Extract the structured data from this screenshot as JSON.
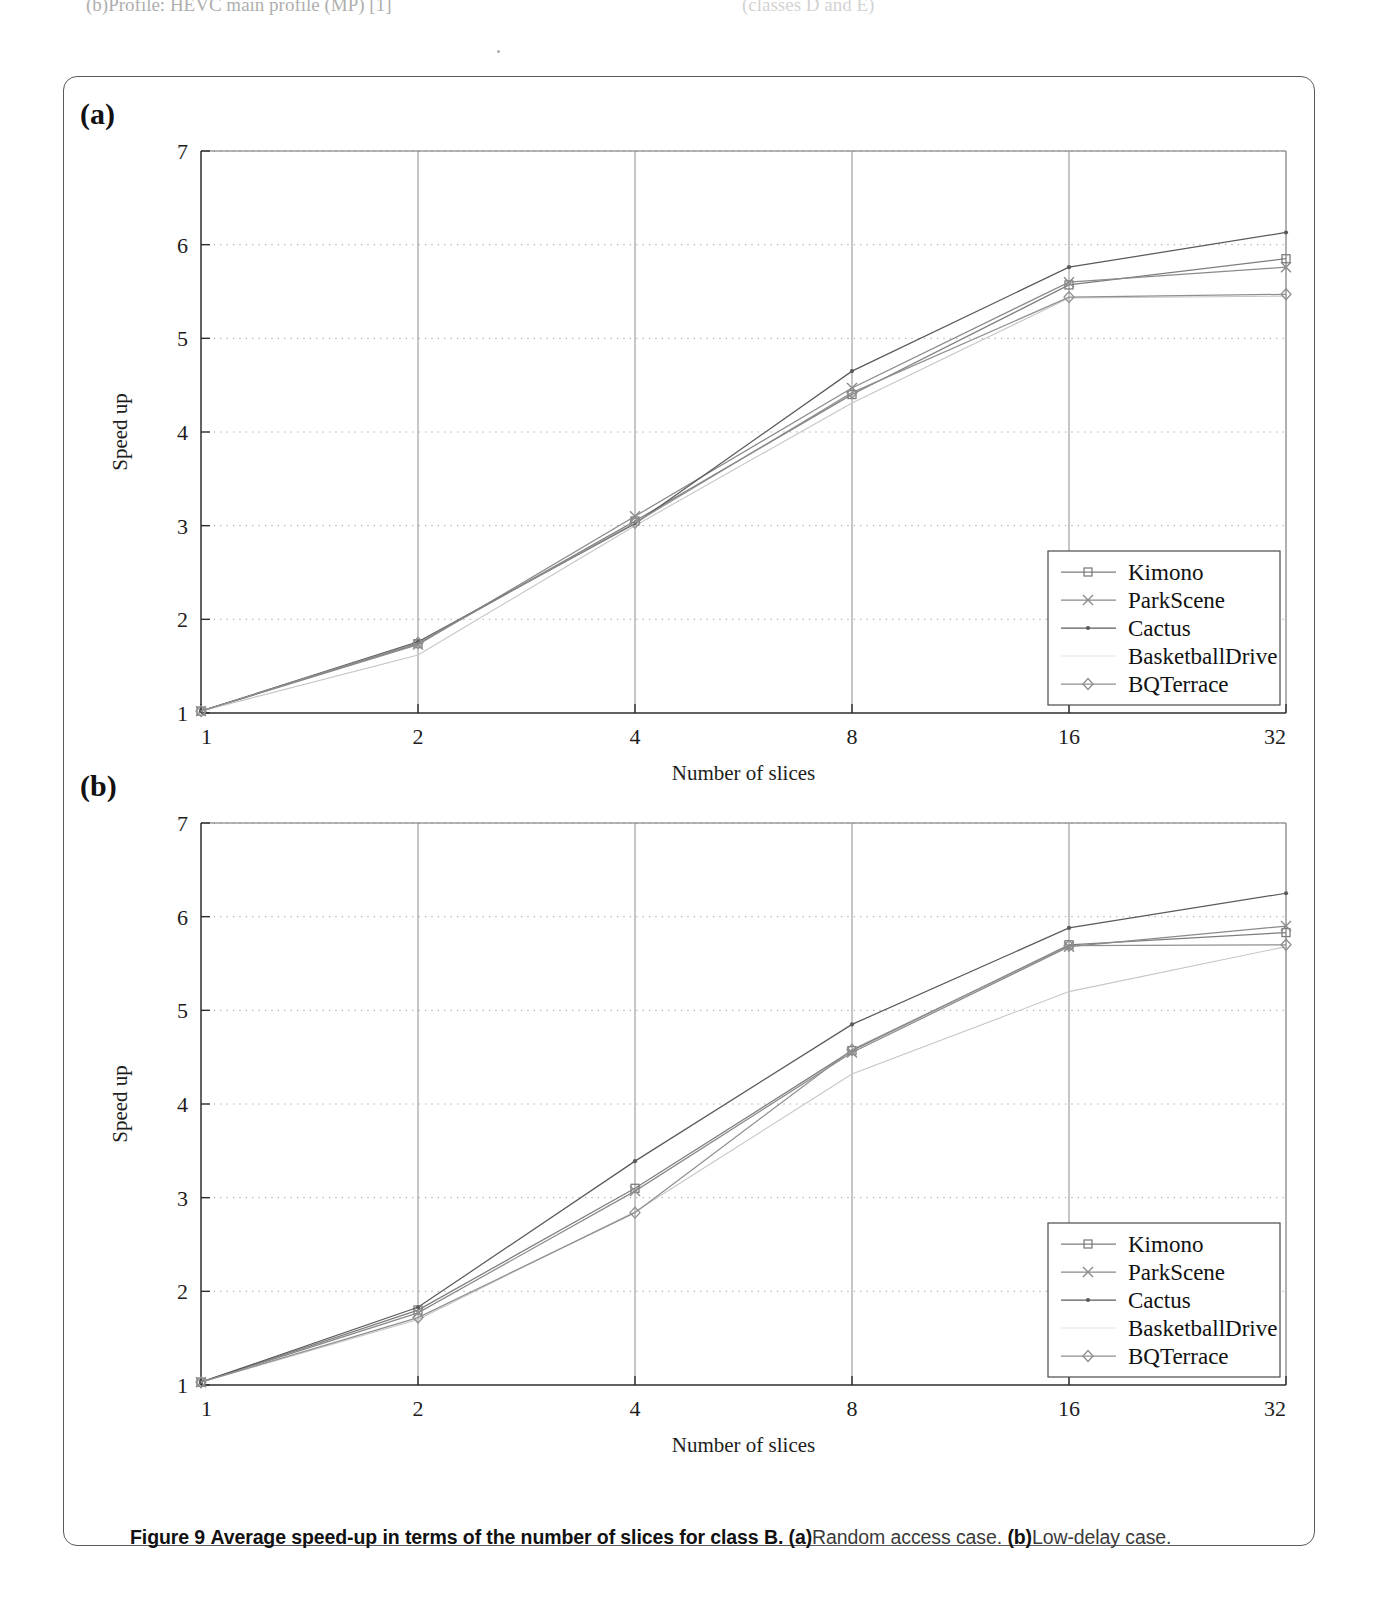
{
  "page_top_text": {
    "left": "(b)Profile: HEVC main profile (MP) [1]",
    "right": "(classes D and E)"
  },
  "figure": {
    "caption_figure_number": "Figure 9",
    "caption_main": "Average speed-up in terms of the number of slices for class B.",
    "caption_a_tag": "(a)",
    "caption_a_text": "Random access case.",
    "caption_b_tag": "(b)",
    "caption_b_text": "Low-delay case."
  },
  "panels": [
    {
      "tag": "(a)"
    },
    {
      "tag": "(b)"
    }
  ],
  "chart_data": [
    {
      "type": "line",
      "panel": "(a)",
      "title": "Random access case",
      "xlabel": "Number of slices",
      "ylabel": "Speed up",
      "x": [
        1,
        2,
        4,
        8,
        16,
        32
      ],
      "xticklabels": [
        "1",
        "2",
        "4",
        "8",
        "16",
        "32"
      ],
      "yticklabels": [
        "1",
        "2",
        "3",
        "4",
        "5",
        "6",
        "7"
      ],
      "ylim": [
        1,
        7
      ],
      "grid": "horizontal-dotted",
      "legend_position": "lower-right",
      "series": [
        {
          "name": "Kimono",
          "marker": "square",
          "values": [
            1.02,
            1.74,
            3.05,
            4.4,
            5.57,
            5.85
          ]
        },
        {
          "name": "ParkScene",
          "marker": "cross",
          "values": [
            1.02,
            1.73,
            3.1,
            4.47,
            5.6,
            5.76
          ]
        },
        {
          "name": "Cactus",
          "marker": "dot",
          "values": [
            1.02,
            1.76,
            3.02,
            4.65,
            5.76,
            6.13
          ]
        },
        {
          "name": "BasketballDrive",
          "marker": "none",
          "values": [
            1.02,
            1.62,
            3.0,
            4.31,
            5.43,
            5.45
          ]
        },
        {
          "name": "BQTerrace",
          "marker": "diamond",
          "values": [
            1.02,
            1.75,
            3.03,
            4.42,
            5.44,
            5.47
          ]
        }
      ]
    },
    {
      "type": "line",
      "panel": "(b)",
      "title": "Low-delay case",
      "xlabel": "Number of slices",
      "ylabel": "Speed up",
      "x": [
        1,
        2,
        4,
        8,
        16,
        32
      ],
      "xticklabels": [
        "1",
        "2",
        "4",
        "8",
        "16",
        "32"
      ],
      "yticklabels": [
        "1",
        "2",
        "3",
        "4",
        "5",
        "6",
        "7"
      ],
      "ylim": [
        1,
        7
      ],
      "grid": "horizontal-dotted",
      "legend_position": "lower-right",
      "series": [
        {
          "name": "Kimono",
          "marker": "square",
          "values": [
            1.03,
            1.8,
            3.1,
            4.57,
            5.7,
            5.83
          ]
        },
        {
          "name": "ParkScene",
          "marker": "cross",
          "values": [
            1.03,
            1.77,
            3.07,
            4.55,
            5.68,
            5.9
          ]
        },
        {
          "name": "Cactus",
          "marker": "dot",
          "values": [
            1.03,
            1.83,
            3.39,
            4.85,
            5.88,
            6.25
          ]
        },
        {
          "name": "BasketballDrive",
          "marker": "none",
          "values": [
            1.03,
            1.7,
            2.85,
            4.32,
            5.2,
            5.68
          ]
        },
        {
          "name": "BQTerrace",
          "marker": "diamond",
          "values": [
            1.03,
            1.72,
            2.84,
            4.58,
            5.69,
            5.7
          ]
        }
      ]
    }
  ],
  "colors": {
    "axis": "#3a3a3a",
    "grid": "#9a9a9a",
    "series": [
      "#7d7d7d",
      "#8a8a8a",
      "#5a5a5a",
      "#c6c6c6",
      "#8f8f8f"
    ]
  }
}
